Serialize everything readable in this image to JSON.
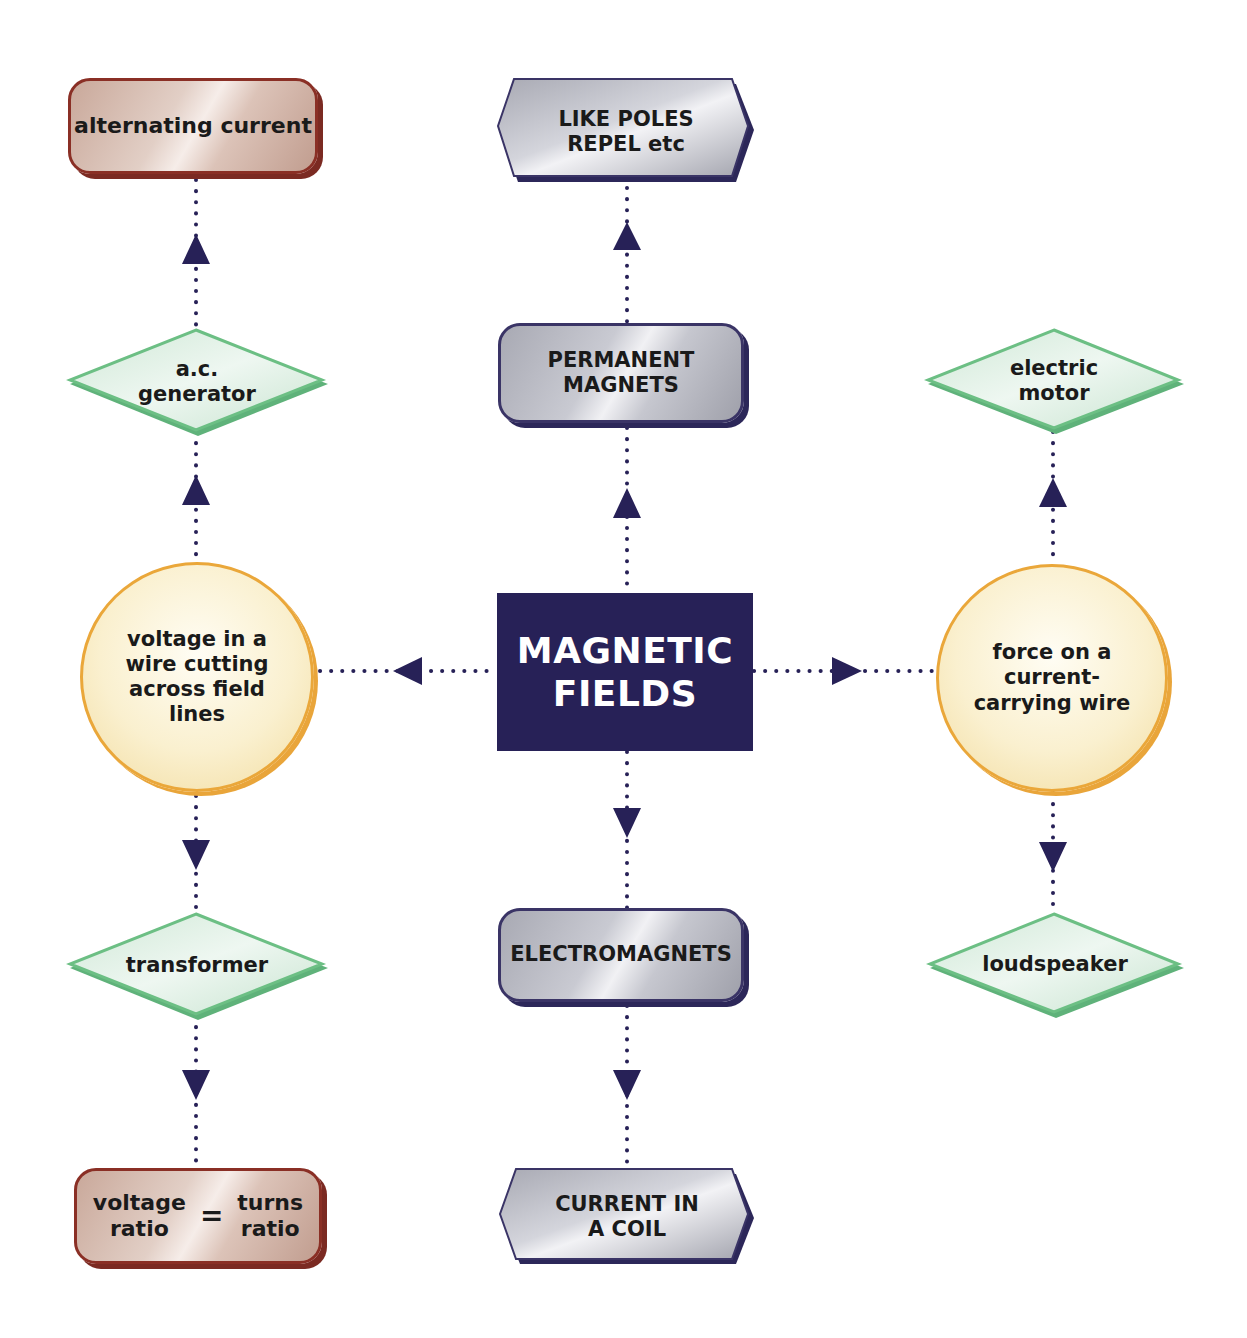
{
  "colors": {
    "central_fill": "#272157",
    "connector": "#272157",
    "brown_border": "#8a2f25",
    "gray_border": "#3a3466",
    "diamond_border": "#6cbf84",
    "diamond_fill": "#dcefe2",
    "circle_border": "#eaa73a",
    "circle_fill": "#faf0cf"
  },
  "nodes": {
    "central": {
      "label": "MAGNETIC\nFIELDS",
      "shape": "rectangle"
    },
    "like_poles": {
      "label": "LIKE POLES\nREPEL etc",
      "shape": "hexagon"
    },
    "permanent_magnets": {
      "label": "PERMANENT\nMAGNETS",
      "shape": "rounded-rectangle"
    },
    "electromagnets": {
      "label": "ELECTROMAGNETS",
      "shape": "rounded-rectangle"
    },
    "current_in_coil": {
      "label": "CURRENT IN\nA COIL",
      "shape": "hexagon"
    },
    "voltage_in_wire": {
      "label": "voltage in a\nwire cutting\nacross field\nlines",
      "shape": "circle"
    },
    "force_on_wire": {
      "label": "force on a\ncurrent-\ncarrying wire",
      "shape": "circle"
    },
    "ac_generator": {
      "label": "a.c.\ngenerator",
      "shape": "diamond"
    },
    "alternating_current": {
      "label": "alternating current",
      "shape": "rounded-rectangle"
    },
    "transformer": {
      "label": "transformer",
      "shape": "diamond"
    },
    "voltage_ratio": {
      "left": "voltage\nratio",
      "eq": "=",
      "right": "turns\nratio",
      "shape": "rounded-rectangle"
    },
    "electric_motor": {
      "label": "electric\nmotor",
      "shape": "diamond"
    },
    "loudspeaker": {
      "label": "loudspeaker",
      "shape": "diamond"
    }
  },
  "edges": [
    {
      "from": "central",
      "to": "permanent_magnets",
      "direction": "up"
    },
    {
      "from": "permanent_magnets",
      "to": "like_poles",
      "direction": "up"
    },
    {
      "from": "central",
      "to": "electromagnets",
      "direction": "down"
    },
    {
      "from": "electromagnets",
      "to": "current_in_coil",
      "direction": "down"
    },
    {
      "from": "central",
      "to": "voltage_in_wire",
      "direction": "left"
    },
    {
      "from": "central",
      "to": "force_on_wire",
      "direction": "right"
    },
    {
      "from": "voltage_in_wire",
      "to": "ac_generator",
      "direction": "up"
    },
    {
      "from": "ac_generator",
      "to": "alternating_current",
      "direction": "up"
    },
    {
      "from": "voltage_in_wire",
      "to": "transformer",
      "direction": "down"
    },
    {
      "from": "transformer",
      "to": "voltage_ratio",
      "direction": "down"
    },
    {
      "from": "force_on_wire",
      "to": "electric_motor",
      "direction": "up"
    },
    {
      "from": "force_on_wire",
      "to": "loudspeaker",
      "direction": "down"
    }
  ]
}
